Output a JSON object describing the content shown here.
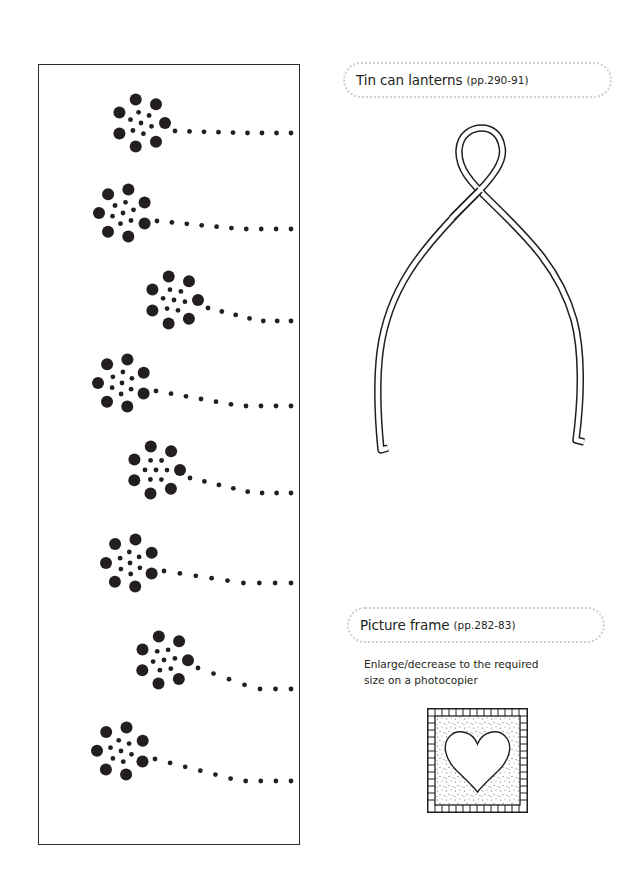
{
  "page": {
    "background": "#ffffff",
    "ink_color": "#231f20"
  },
  "sections": [
    {
      "id": "tin-can-lanterns",
      "title": "Tin can lanterns",
      "pages": "(pp.290-91)",
      "template": "wishbone-shape-outline"
    },
    {
      "id": "picture-frame",
      "title": "Picture frame",
      "pages": "(pp.282-83)",
      "note_line1": "Enlarge/decrease to the required",
      "note_line2": "size on a photocopier",
      "template": "heart-frame-with-checkered-border"
    }
  ],
  "flower_panel": {
    "description": "Punched dot flower pattern strip",
    "flowers": [
      {
        "cx": 140,
        "cy": 122,
        "stem_end_y": 132
      },
      {
        "cx": 122,
        "cy": 212,
        "stem_end_y": 228
      },
      {
        "cx": 173,
        "cy": 299,
        "stem_end_y": 320
      },
      {
        "cx": 121,
        "cy": 382,
        "stem_end_y": 405
      },
      {
        "cx": 155,
        "cy": 469,
        "stem_end_y": 492
      },
      {
        "cx": 129,
        "cy": 562,
        "stem_end_y": 582
      },
      {
        "cx": 163,
        "cy": 659,
        "stem_end_y": 688
      },
      {
        "cx": 120,
        "cy": 750,
        "stem_end_y": 780
      }
    ]
  }
}
